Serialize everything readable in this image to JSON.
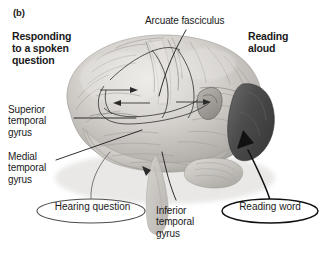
{
  "figure": {
    "panel_letter": "(b)",
    "background_color": "#ffffff",
    "text_color": "#1a1a1a"
  },
  "headings": {
    "left": "Responding\nto a spoken\nquestion",
    "right": "Reading\naloud"
  },
  "annotations": {
    "arcuate_fasciculus": "Arcuate fasciculus",
    "superior_temporal_gyrus": "Superior\ntemporal\ngyrus",
    "medial_temporal_gyrus": "Medial\ntemporal\ngyrus",
    "inferior_temporal_gyrus": "Inferior\ntemporal\ngyrus"
  },
  "callouts": {
    "hearing": "Hearing question",
    "reading": "Reading word"
  },
  "colors": {
    "brain_light": "#d8d6d3",
    "brain_mid": "#b8b5b1",
    "brain_shadow": "#8d8a86",
    "occipital_highlight": "#4a4a4a",
    "leader_line": "#1a1a1a",
    "callout_stroke": "#555555"
  }
}
